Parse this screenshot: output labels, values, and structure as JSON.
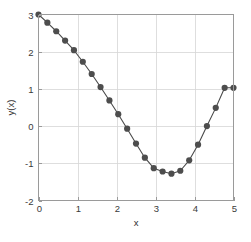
{
  "chart_data": {
    "type": "line",
    "title": "",
    "subtitle": "",
    "xlabel": "x",
    "ylabel": "y(x)",
    "xlim": [
      0,
      5
    ],
    "ylim": [
      -2,
      3
    ],
    "xticks": [
      0,
      1,
      2,
      3,
      4,
      5
    ],
    "xtick_labels": [
      "0",
      "1",
      "2",
      "3",
      "4",
      "5"
    ],
    "yticks": [
      -2,
      -1,
      0,
      1,
      2,
      3
    ],
    "ytick_labels": [
      "-2",
      "-1",
      "0",
      "1",
      "2",
      "3"
    ],
    "grid": true,
    "legend": null,
    "marker": "filled-circle",
    "marker_color": "#4d4d4d",
    "line_color": "#4a4a4a",
    "frame_color": "#9a9a9a",
    "grid_color": "#d6d6d6",
    "background_color": "#ffffff",
    "series": [
      {
        "name": "y(x)",
        "x": [
          0.0,
          0.227,
          0.455,
          0.682,
          0.909,
          1.136,
          1.364,
          1.591,
          1.818,
          2.045,
          2.273,
          2.5,
          2.727,
          2.955,
          3.182,
          3.409,
          3.636,
          3.864,
          4.091,
          4.318,
          4.545,
          4.773,
          5.0
        ],
        "y": [
          3.0,
          2.78,
          2.55,
          2.3,
          2.04,
          1.73,
          1.4,
          1.05,
          0.69,
          0.32,
          -0.07,
          -0.47,
          -0.85,
          -1.13,
          -1.22,
          -1.28,
          -1.2,
          -0.92,
          -0.5,
          0.0,
          0.49,
          1.03,
          1.03
        ]
      }
    ]
  },
  "axes": {
    "x_axis_label": "x",
    "y_axis_label": "y(x)"
  }
}
